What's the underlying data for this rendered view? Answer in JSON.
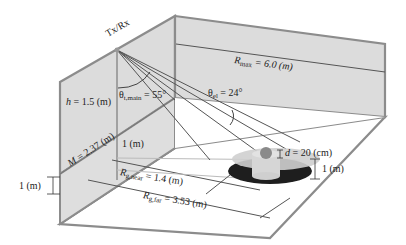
{
  "figure": {
    "device_label": "Tx/Rx",
    "labels": {
      "h": {
        "symbol": "h",
        "value": "= 1.5 (m)"
      },
      "M": {
        "symbol": "M",
        "value": "= 2.37 (m)"
      },
      "theta_main": {
        "symbol": "θ",
        "subscript": "t,main",
        "value": "= 55°"
      },
      "theta_el": {
        "symbol": "θ",
        "subscript": "el",
        "value": "= 24°"
      },
      "r_max": {
        "symbol": "R",
        "subscript": "max",
        "value": "= 6.0 (m)"
      },
      "r_near": {
        "symbol": "R",
        "subscript": "g,near",
        "value": "= 1.4 (m)"
      },
      "r_far": {
        "symbol": "R",
        "subscript": "g,far",
        "value": "= 3.53 (m)"
      },
      "d": {
        "symbol": "d",
        "value": "= 20 (cm)"
      },
      "one_m_inner": "1 (m)",
      "one_m_target": "1 (m)",
      "one_m_left": "1 (m)"
    },
    "colors": {
      "wall_fill": "#dcdcdc",
      "wall_edge": "#8c8c8c",
      "line": "#555555",
      "disc_dark": "#1e1e1e",
      "disc_light": "#c8c8c8",
      "cylinder": "#d2d2d2",
      "sphere": "#8a8a8a",
      "floor": "#ffffff"
    }
  }
}
